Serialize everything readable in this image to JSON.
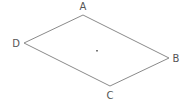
{
  "diagram": {
    "type": "parallelogram",
    "vertices": [
      {
        "name": "A",
        "x": 83,
        "y": 15,
        "label_x": 83,
        "label_y": 10
      },
      {
        "name": "B",
        "x": 169,
        "y": 58,
        "label_x": 176,
        "label_y": 62
      },
      {
        "name": "C",
        "x": 110,
        "y": 86,
        "label_x": 110,
        "label_y": 99
      },
      {
        "name": "D",
        "x": 24,
        "y": 43,
        "label_x": 16,
        "label_y": 47
      }
    ],
    "edges": [
      [
        "A",
        "B"
      ],
      [
        "B",
        "C"
      ],
      [
        "C",
        "D"
      ],
      [
        "D",
        "A"
      ]
    ],
    "center_point": {
      "x": 97,
      "y": 51
    },
    "colors": {
      "stroke": "#8a8a8a",
      "label": "#555555",
      "background": "#ffffff"
    }
  },
  "labels": {
    "A": "A",
    "B": "B",
    "C": "C",
    "D": "D"
  }
}
